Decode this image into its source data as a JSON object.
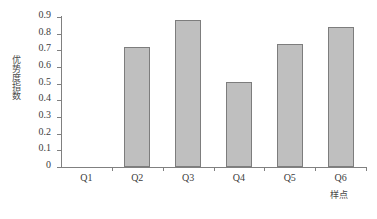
{
  "chart_data": {
    "type": "bar",
    "title": "",
    "subtitle": "",
    "categories": [
      "Q1",
      "Q2",
      "Q3",
      "Q4",
      "Q5",
      "Q6"
    ],
    "values": [
      0,
      0.72,
      0.88,
      0.51,
      0.74,
      0.84
    ],
    "xlabel": "样点",
    "ylabel": "优势度指数",
    "ylim": [
      0,
      0.9
    ],
    "yticks": [
      0,
      0.1,
      0.2,
      0.3,
      0.4,
      0.5,
      0.6,
      0.7,
      0.8,
      0.9
    ],
    "ytick_labels": [
      "0",
      "0.1",
      "0.2",
      "0.3",
      "0.4",
      "0.5",
      "0.6",
      "0.7",
      "0.8",
      "0.9"
    ],
    "grid": false,
    "legend": false,
    "legend_position": "none",
    "bar_fill_color": "#bfbfbf",
    "bar_border_color": "#7d7d7d",
    "axis_color": "#808080",
    "text_color": "#3d3d3d",
    "background_color": "#ffffff"
  }
}
